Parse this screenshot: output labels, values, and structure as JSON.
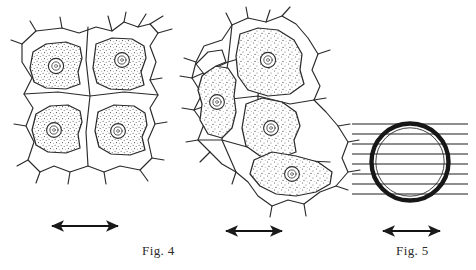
{
  "plate": {
    "background_color": "#ffffff",
    "ink_color": "#1a1a1a",
    "stipple_color": "#3a3a3a"
  },
  "figures": [
    {
      "id": "fig4",
      "caption": "Fig. 4",
      "subject": "plant-cells-plasmolysis",
      "panels": [
        {
          "id": "fig4-left-cluster",
          "cell_count": 4,
          "nuclei_count": 4
        },
        {
          "id": "fig4-right-cluster",
          "cell_count": 5,
          "nuclei_count": 4
        }
      ],
      "scale_arrows": [
        {
          "id": "arrow-fig4-left",
          "direction": "double-horizontal"
        },
        {
          "id": "arrow-fig4-right",
          "direction": "double-horizontal"
        }
      ]
    },
    {
      "id": "fig5",
      "caption": "Fig. 5",
      "subject": "circular-cell-cross-section",
      "ring": {
        "outer_wall": "thick",
        "inner_wall": "thin"
      },
      "hatch_lines": 8,
      "scale_arrows": [
        {
          "id": "arrow-fig5",
          "direction": "double-horizontal"
        }
      ]
    }
  ],
  "captions": {
    "fig4": "Fig. 4",
    "fig5": "Fig. 5"
  }
}
